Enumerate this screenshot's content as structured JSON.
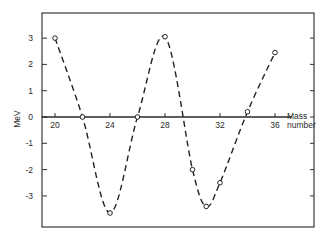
{
  "chart_data": {
    "type": "line",
    "title": "",
    "xlabel": "Mass number",
    "xlabel_lines": [
      "Mass",
      "number"
    ],
    "ylabel": "MeV",
    "xlim": [
      19,
      37
    ],
    "ylim": [
      -4.2,
      4.0
    ],
    "xticks": [
      20,
      24,
      28,
      32,
      36
    ],
    "xtick_labels": [
      "20",
      "24",
      "28",
      "32",
      "36"
    ],
    "yticks": [
      3,
      2,
      1,
      0,
      -1,
      -2,
      -3
    ],
    "ytick_labels": [
      "3",
      "2",
      "1",
      "0",
      "-1",
      "-2",
      "-3"
    ],
    "grid": false,
    "legend": null,
    "line_style": "dashed",
    "marker": "open-circle",
    "series": [
      {
        "name": "MeV vs mass number",
        "x": [
          20,
          22,
          24,
          26,
          28,
          30,
          31,
          32,
          34,
          36
        ],
        "y": [
          3.0,
          0.0,
          -3.65,
          0.0,
          3.05,
          -2.0,
          -3.4,
          -2.5,
          0.2,
          2.45
        ]
      }
    ]
  }
}
